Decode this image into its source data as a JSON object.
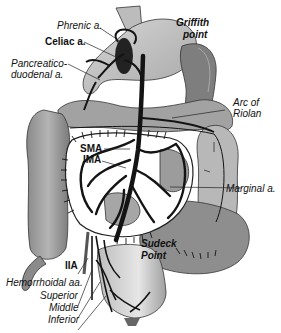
{
  "figure": {
    "type": "anatomical-diagram"
  },
  "labels": {
    "phrenic": "Phrenic a.",
    "celiac": "Celiac a.",
    "pancreatico_1": "Pancreatico-",
    "pancreatico_2": "duodenal a.",
    "griffith_1": "Griffith",
    "griffith_2": "point",
    "arc_1": "Arc of",
    "arc_2": "Riolan",
    "sma": "SMA",
    "ima": "IMA",
    "marginal": "Marginal a.",
    "sudeck_1": "Sudeck",
    "sudeck_2": "Point",
    "iia": "IIA",
    "hemorrhoidal": "Hemorrhoidal aa.",
    "superior": "Superior",
    "middle": "Middle",
    "inferior": "Inferior"
  },
  "colors": {
    "organ_light": "#c8c8c8",
    "organ_mid": "#9a9a9a",
    "organ_dark": "#6e6e6e",
    "artery": "#141414",
    "mesentery": "#ffffff"
  }
}
